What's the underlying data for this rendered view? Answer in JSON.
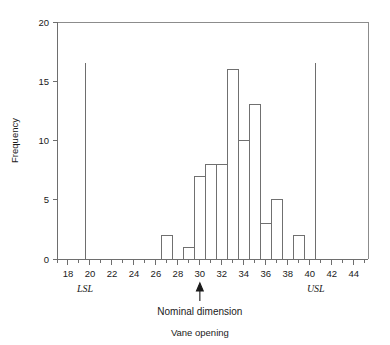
{
  "chart_data": {
    "type": "bar",
    "title": "",
    "subtitle": "",
    "xlabel": "Vane opening",
    "ylabel": "Frequency",
    "xlim": [
      17.0,
      45.3
    ],
    "ylim": [
      0,
      20
    ],
    "grid": false,
    "legend": "none",
    "bin_width": 1,
    "x_tick_labels": [
      "18",
      "20",
      "22",
      "24",
      "26",
      "28",
      "30",
      "32",
      "34",
      "36",
      "38",
      "40",
      "42",
      "44"
    ],
    "x_tick_values": [
      18,
      20,
      22,
      24,
      26,
      28,
      30,
      32,
      34,
      36,
      38,
      40,
      42,
      44
    ],
    "x_minor_tick_values": [
      17,
      19,
      21,
      23,
      25,
      27,
      29,
      31,
      33,
      35,
      37,
      39,
      41,
      43,
      45
    ],
    "y_tick_labels": [
      "0",
      "5",
      "10",
      "15",
      "20"
    ],
    "y_tick_values": [
      0,
      5,
      10,
      15,
      20
    ],
    "bins": [
      {
        "start": 26.5,
        "end": 27.5,
        "value": 2
      },
      {
        "start": 28.5,
        "end": 29.5,
        "value": 1
      },
      {
        "start": 29.5,
        "end": 30.5,
        "value": 7
      },
      {
        "start": 30.5,
        "end": 31.5,
        "value": 8
      },
      {
        "start": 31.5,
        "end": 32.5,
        "value": 8
      },
      {
        "start": 32.5,
        "end": 33.5,
        "value": 16
      },
      {
        "start": 33.5,
        "end": 34.5,
        "value": 10
      },
      {
        "start": 34.5,
        "end": 35.5,
        "value": 13
      },
      {
        "start": 35.5,
        "end": 36.5,
        "value": 3
      },
      {
        "start": 36.5,
        "end": 37.5,
        "value": 5
      },
      {
        "start": 38.5,
        "end": 39.5,
        "value": 2
      }
    ],
    "annotations": [
      {
        "name": "lsl",
        "label": "LSL",
        "x": 19.55,
        "y_top": 16.5,
        "kind": "vertical-line"
      },
      {
        "name": "usl",
        "label": "USL",
        "x": 40.55,
        "y_top": 16.5,
        "kind": "vertical-line"
      },
      {
        "name": "nominal",
        "label": "Nominal dimension",
        "x": 30,
        "kind": "up-arrow"
      }
    ],
    "colors": {
      "bar_fill": "#ffffff",
      "bar_stroke": "#707070",
      "axis": "#6e6e6e",
      "text": "#1a1a1a"
    }
  },
  "labels": {
    "y_axis_title": "Frequency",
    "x_axis_title": "Vane opening",
    "nominal_text": "Nominal dimension",
    "lsl_text": "LSL",
    "usl_text": "USL"
  }
}
